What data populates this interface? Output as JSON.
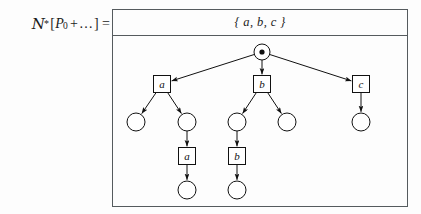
{
  "equation": {
    "operator": "N",
    "operator_star": "*",
    "open_bracket": "[",
    "process": "P",
    "process_subscript": "0",
    "plus": "+",
    "ellipsis": "…",
    "close_bracket": "]",
    "equals": "="
  },
  "diagram": {
    "header": {
      "marking_set": "{ a, b, c }"
    },
    "style": {
      "border_color": "#555b5e",
      "node_stroke": "#111111",
      "arrow_color": "#111111",
      "background": "#fdfdfd"
    },
    "tree": {
      "root": {
        "id": "root",
        "shape": "circle-with-token",
        "label": "",
        "cx": 149,
        "cy": 16,
        "r": 8,
        "token_r": 2.6
      },
      "nodes": [
        {
          "id": "box-a-1",
          "shape": "box",
          "label": "a",
          "cx": 49,
          "cy": 48,
          "w": 17,
          "h": 17
        },
        {
          "id": "box-b-1",
          "shape": "box",
          "label": "b",
          "cx": 149,
          "cy": 48,
          "w": 17,
          "h": 17
        },
        {
          "id": "box-c-1",
          "shape": "box",
          "label": "c",
          "cx": 248,
          "cy": 48,
          "w": 17,
          "h": 17
        },
        {
          "id": "circle-a-l",
          "shape": "circle",
          "label": "",
          "cx": 23,
          "cy": 86,
          "r": 9
        },
        {
          "id": "circle-a-r",
          "shape": "circle",
          "label": "",
          "cx": 74,
          "cy": 86,
          "r": 9
        },
        {
          "id": "circle-b-l",
          "shape": "circle",
          "label": "",
          "cx": 124,
          "cy": 86,
          "r": 9
        },
        {
          "id": "circle-b-r",
          "shape": "circle",
          "label": "",
          "cx": 174,
          "cy": 86,
          "r": 9
        },
        {
          "id": "circle-c",
          "shape": "circle",
          "label": "",
          "cx": 248,
          "cy": 86,
          "r": 9
        },
        {
          "id": "box-a-2",
          "shape": "box",
          "label": "a",
          "cx": 74,
          "cy": 120,
          "w": 17,
          "h": 17
        },
        {
          "id": "box-b-2",
          "shape": "box",
          "label": "b",
          "cx": 124,
          "cy": 120,
          "w": 17,
          "h": 17
        },
        {
          "id": "circle-a-leaf",
          "shape": "circle",
          "label": "",
          "cx": 74,
          "cy": 154,
          "r": 9
        },
        {
          "id": "circle-b-leaf",
          "shape": "circle",
          "label": "",
          "cx": 124,
          "cy": 154,
          "r": 9
        }
      ],
      "edges": [
        {
          "from": "root",
          "to": "box-a-1"
        },
        {
          "from": "root",
          "to": "box-b-1"
        },
        {
          "from": "root",
          "to": "box-c-1"
        },
        {
          "from": "box-a-1",
          "to": "circle-a-l"
        },
        {
          "from": "box-a-1",
          "to": "circle-a-r"
        },
        {
          "from": "box-b-1",
          "to": "circle-b-l"
        },
        {
          "from": "box-b-1",
          "to": "circle-b-r"
        },
        {
          "from": "box-c-1",
          "to": "circle-c"
        },
        {
          "from": "circle-a-r",
          "to": "box-a-2"
        },
        {
          "from": "circle-b-l",
          "to": "box-b-2"
        },
        {
          "from": "box-a-2",
          "to": "circle-a-leaf"
        },
        {
          "from": "box-b-2",
          "to": "circle-b-leaf"
        }
      ]
    }
  }
}
